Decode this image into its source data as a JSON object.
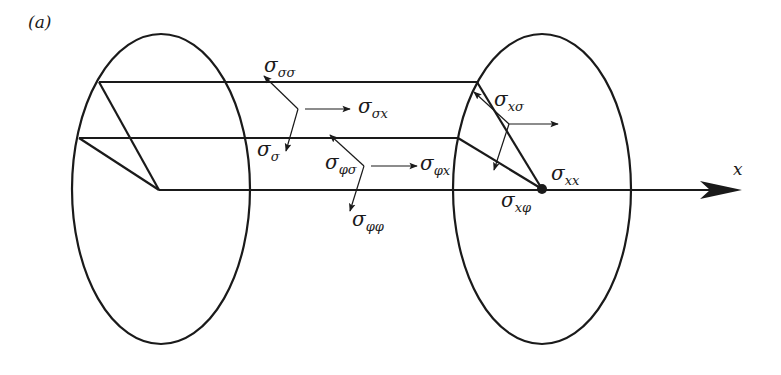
{
  "figure": {
    "panel_label": "(a)",
    "axis_label": "x",
    "colors": {
      "stroke": "#1a1a1a",
      "background": "#ffffff"
    }
  },
  "labels": {
    "sigma_sigma_sigma": {
      "symbol": "σ",
      "subscript": "σσ"
    },
    "sigma_sigma_x": {
      "symbol": "σ",
      "subscript": "σx"
    },
    "sigma_sigma": {
      "symbol": "σ",
      "subscript": "σ"
    },
    "sigma_phi_sigma": {
      "symbol": "σ",
      "subscript": "φσ"
    },
    "sigma_phi_x": {
      "symbol": "σ",
      "subscript": "φx"
    },
    "sigma_phi_phi": {
      "symbol": "σ",
      "subscript": "φφ"
    },
    "sigma_x_sigma": {
      "symbol": "σ",
      "subscript": "xσ"
    },
    "sigma_x_x": {
      "symbol": "σ",
      "subscript": "xx"
    },
    "sigma_x_phi": {
      "symbol": "σ",
      "subscript": "xφ"
    }
  }
}
